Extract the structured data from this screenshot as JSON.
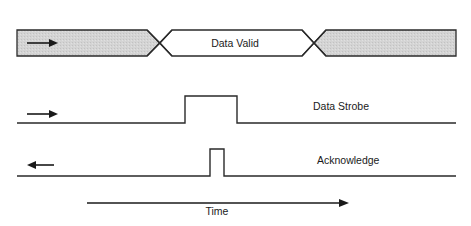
{
  "diagram": {
    "type": "timing-diagram",
    "colors": {
      "line": "#2a2a2a",
      "shade": "#d2d2d2",
      "background": "#ffffff"
    },
    "bus": {
      "label": "Data Valid",
      "left_region_direction": "right",
      "phases": [
        "invalid (shaded)",
        "valid",
        "invalid (shaded)"
      ]
    },
    "signals": [
      {
        "label": "Data Strobe",
        "direction_arrow": "right",
        "pulse": "wide"
      },
      {
        "label": "Acknowledge",
        "direction_arrow": "left",
        "pulse": "narrow"
      }
    ],
    "time_axis": {
      "label": "Time",
      "direction": "right"
    }
  }
}
